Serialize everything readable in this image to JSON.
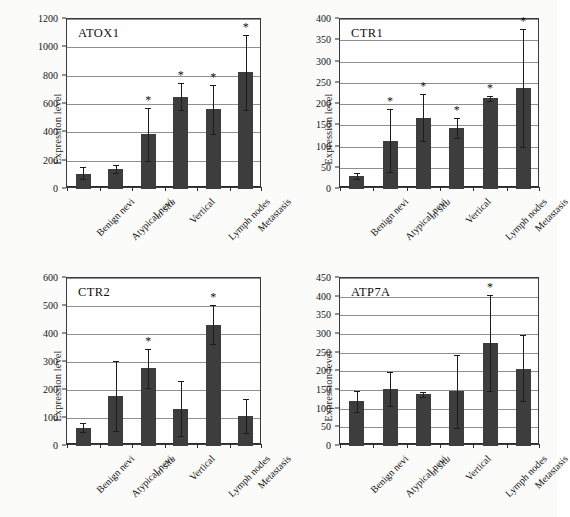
{
  "figure": {
    "ylabel": "Expression level",
    "categories": [
      "Benign nevi",
      "Atypical nevi",
      "in situ",
      "Vertical",
      "Lymph nodes",
      "Metastasis"
    ],
    "italic_categories": [
      "in situ"
    ],
    "significance_marker": "*",
    "bar_color": "#3d3d3d",
    "panels": [
      "ATOX1",
      "CTR1",
      "CTR2",
      "ATP7A"
    ]
  },
  "chart_data": [
    {
      "type": "bar",
      "title": "ATOX1",
      "xlabel": "",
      "ylabel": "Expression level",
      "categories": [
        "Benign nevi",
        "Atypical nevi",
        "in situ",
        "Vertical",
        "Lymph nodes",
        "Metastasis"
      ],
      "values": [
        108,
        140,
        388,
        650,
        563,
        825
      ],
      "err_low": [
        40,
        28,
        190,
        90,
        172,
        265
      ],
      "err_high": [
        45,
        32,
        185,
        95,
        172,
        265
      ],
      "significance": [
        "",
        "",
        "*",
        "*",
        "*",
        "*"
      ],
      "ylim": [
        0,
        1200
      ],
      "yticks": [
        0,
        200,
        400,
        600,
        800,
        1000,
        1200
      ],
      "grid": true,
      "legend": "none"
    },
    {
      "type": "bar",
      "title": "CTR1",
      "xlabel": "",
      "ylabel": "Expression level",
      "categories": [
        "Benign nevi",
        "Atypical nevi",
        "in situ",
        "Vertical",
        "Lymph nodes",
        "Metastasis"
      ],
      "values": [
        30,
        114,
        167,
        144,
        213,
        238
      ],
      "err_low": [
        6,
        75,
        53,
        24,
        6,
        139
      ],
      "err_high": [
        7,
        75,
        57,
        24,
        5,
        139
      ],
      "significance": [
        "",
        "*",
        "*",
        "*",
        "*",
        "*"
      ],
      "ylim": [
        0,
        400
      ],
      "yticks": [
        0,
        50,
        100,
        150,
        200,
        250,
        300,
        350,
        400
      ],
      "grid": true,
      "legend": "none"
    },
    {
      "type": "bar",
      "title": "CTR2",
      "xlabel": "",
      "ylabel": "Expression level",
      "categories": [
        "Benign nevi",
        "Atypical nevi",
        "in situ",
        "Vertical",
        "Lymph nodes",
        "Metastasis"
      ],
      "values": [
        65,
        178,
        278,
        133,
        433,
        108
      ],
      "err_low": [
        15,
        125,
        70,
        98,
        70,
        60
      ],
      "err_high": [
        16,
        125,
        70,
        98,
        70,
        60
      ],
      "significance": [
        "",
        "",
        "*",
        "",
        "*",
        ""
      ],
      "ylim": [
        0,
        600
      ],
      "yticks": [
        0,
        100,
        200,
        300,
        400,
        500,
        600
      ],
      "grid": true,
      "legend": "none"
    },
    {
      "type": "bar",
      "title": "ATP7A",
      "xlabel": "",
      "ylabel": "Expression level",
      "categories": [
        "Benign nevi",
        "Atypical nevi",
        "in situ",
        "Vertical",
        "Lymph nodes",
        "Metastasis"
      ],
      "values": [
        120,
        152,
        138,
        146,
        275,
        207
      ],
      "err_low": [
        28,
        45,
        6,
        98,
        128,
        86
      ],
      "err_high": [
        28,
        46,
        7,
        99,
        130,
        90
      ],
      "significance": [
        "",
        "",
        "",
        "",
        "*",
        ""
      ],
      "ylim": [
        0,
        450
      ],
      "yticks": [
        0,
        50,
        100,
        150,
        200,
        250,
        300,
        350,
        400,
        450
      ],
      "grid": true,
      "legend": "none"
    }
  ]
}
